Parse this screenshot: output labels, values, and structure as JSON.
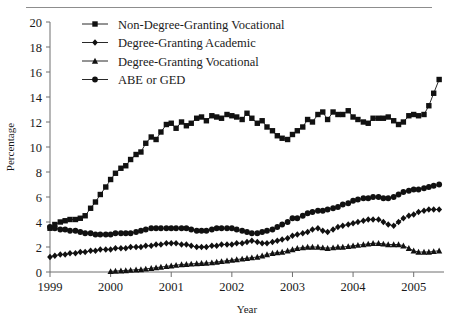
{
  "chart_data": {
    "type": "line",
    "title": "",
    "xlabel": "Year",
    "ylabel": "Percentage",
    "xlim": [
      1999,
      2005.5
    ],
    "ylim": [
      0,
      20
    ],
    "ytick_step": 2,
    "grid": false,
    "legend_position": "top-left-inside",
    "xticks": [
      "1999",
      "2000",
      "2001",
      "2002",
      "2003",
      "2004",
      "2005"
    ],
    "xtick_values": [
      1999,
      2000,
      2001,
      2002,
      2003,
      2004,
      2005
    ],
    "yticks": [
      "0",
      "2",
      "4",
      "6",
      "8",
      "10",
      "12",
      "14",
      "16",
      "18",
      "20"
    ],
    "ytick_values": [
      0,
      2,
      4,
      6,
      8,
      10,
      12,
      14,
      16,
      18,
      20
    ],
    "marker_color": "#111111",
    "line_color": "#111111",
    "series": [
      {
        "name": "Non-Degree-Granting Vocational",
        "marker": "square",
        "x": [
          1999.0,
          1999.08,
          1999.17,
          1999.25,
          1999.33,
          1999.42,
          1999.5,
          1999.58,
          1999.67,
          1999.75,
          1999.83,
          1999.92,
          2000.0,
          2000.08,
          2000.17,
          2000.25,
          2000.33,
          2000.42,
          2000.5,
          2000.58,
          2000.67,
          2000.75,
          2000.83,
          2000.92,
          2001.0,
          2001.08,
          2001.17,
          2001.25,
          2001.33,
          2001.42,
          2001.5,
          2001.58,
          2001.67,
          2001.75,
          2001.83,
          2001.92,
          2002.0,
          2002.08,
          2002.17,
          2002.25,
          2002.33,
          2002.42,
          2002.5,
          2002.58,
          2002.67,
          2002.75,
          2002.83,
          2002.92,
          2003.0,
          2003.08,
          2003.17,
          2003.25,
          2003.33,
          2003.42,
          2003.5,
          2003.58,
          2003.67,
          2003.75,
          2003.83,
          2003.92,
          2004.0,
          2004.08,
          2004.17,
          2004.25,
          2004.33,
          2004.42,
          2004.5,
          2004.58,
          2004.67,
          2004.75,
          2004.83,
          2004.92,
          2005.0,
          2005.08,
          2005.17,
          2005.25,
          2005.33,
          2005.42
        ],
        "values": [
          3.5,
          3.8,
          4.0,
          4.1,
          4.2,
          4.2,
          4.3,
          4.5,
          5.1,
          5.6,
          6.2,
          6.8,
          7.4,
          7.9,
          8.3,
          8.5,
          9.0,
          9.4,
          9.6,
          10.3,
          10.8,
          10.6,
          11.2,
          11.8,
          11.9,
          11.5,
          12.0,
          11.7,
          11.9,
          12.3,
          12.4,
          12.1,
          12.5,
          12.4,
          12.3,
          12.6,
          12.5,
          12.4,
          12.2,
          12.7,
          12.3,
          11.9,
          12.1,
          11.6,
          11.3,
          10.9,
          10.7,
          10.6,
          11.0,
          11.3,
          11.6,
          12.2,
          12.0,
          12.6,
          12.8,
          12.2,
          12.8,
          12.6,
          12.6,
          12.9,
          12.4,
          12.2,
          12.0,
          11.9,
          12.3,
          12.3,
          12.3,
          12.4,
          12.1,
          11.8,
          12.0,
          12.5,
          12.6,
          12.5,
          12.6,
          13.3,
          14.3,
          15.4
        ]
      },
      {
        "name": "Degree-Granting Academic",
        "marker": "diamond",
        "x": [
          1999.0,
          1999.08,
          1999.17,
          1999.25,
          1999.33,
          1999.42,
          1999.5,
          1999.58,
          1999.67,
          1999.75,
          1999.83,
          1999.92,
          2000.0,
          2000.08,
          2000.17,
          2000.25,
          2000.33,
          2000.42,
          2000.5,
          2000.58,
          2000.67,
          2000.75,
          2000.83,
          2000.92,
          2001.0,
          2001.08,
          2001.17,
          2001.25,
          2001.33,
          2001.42,
          2001.5,
          2001.58,
          2001.67,
          2001.75,
          2001.83,
          2001.92,
          2002.0,
          2002.08,
          2002.17,
          2002.25,
          2002.33,
          2002.42,
          2002.5,
          2002.58,
          2002.67,
          2002.75,
          2002.83,
          2002.92,
          2003.0,
          2003.08,
          2003.17,
          2003.25,
          2003.33,
          2003.42,
          2003.5,
          2003.58,
          2003.67,
          2003.75,
          2003.83,
          2003.92,
          2004.0,
          2004.08,
          2004.17,
          2004.25,
          2004.33,
          2004.42,
          2004.5,
          2004.58,
          2004.67,
          2004.75,
          2004.83,
          2004.92,
          2005.0,
          2005.08,
          2005.17,
          2005.25,
          2005.33,
          2005.42
        ],
        "values": [
          1.2,
          1.3,
          1.4,
          1.4,
          1.5,
          1.5,
          1.6,
          1.6,
          1.7,
          1.7,
          1.8,
          1.8,
          1.8,
          1.9,
          1.9,
          1.9,
          2.0,
          2.0,
          2.0,
          2.1,
          2.1,
          2.2,
          2.2,
          2.3,
          2.3,
          2.3,
          2.2,
          2.2,
          2.1,
          2.0,
          2.0,
          2.0,
          2.1,
          2.1,
          2.2,
          2.2,
          2.2,
          2.3,
          2.3,
          2.4,
          2.5,
          2.4,
          2.3,
          2.3,
          2.4,
          2.5,
          2.6,
          2.7,
          2.9,
          3.0,
          3.1,
          3.2,
          3.4,
          3.5,
          3.3,
          3.2,
          3.4,
          3.6,
          3.7,
          3.8,
          3.9,
          4.0,
          4.1,
          4.2,
          4.2,
          4.2,
          4.0,
          3.8,
          3.7,
          4.0,
          4.3,
          4.5,
          4.6,
          4.8,
          4.9,
          5.0,
          5.0,
          5.0
        ]
      },
      {
        "name": "Degree-Granting Vocational",
        "marker": "triangle",
        "x": [
          2000.0,
          2000.08,
          2000.17,
          2000.25,
          2000.33,
          2000.42,
          2000.5,
          2000.58,
          2000.67,
          2000.75,
          2000.83,
          2000.92,
          2001.0,
          2001.08,
          2001.17,
          2001.25,
          2001.33,
          2001.42,
          2001.5,
          2001.58,
          2001.67,
          2001.75,
          2001.83,
          2001.92,
          2002.0,
          2002.08,
          2002.17,
          2002.25,
          2002.33,
          2002.42,
          2002.5,
          2002.58,
          2002.67,
          2002.75,
          2002.83,
          2002.92,
          2003.0,
          2003.08,
          2003.17,
          2003.25,
          2003.33,
          2003.42,
          2003.5,
          2003.58,
          2003.67,
          2003.75,
          2003.83,
          2003.92,
          2004.0,
          2004.08,
          2004.17,
          2004.25,
          2004.33,
          2004.42,
          2004.5,
          2004.58,
          2004.67,
          2004.75,
          2004.83,
          2004.92,
          2005.0,
          2005.08,
          2005.17,
          2005.25,
          2005.33,
          2005.42
        ],
        "values": [
          0.05,
          0.08,
          0.1,
          0.12,
          0.15,
          0.18,
          0.2,
          0.25,
          0.3,
          0.35,
          0.4,
          0.45,
          0.5,
          0.55,
          0.6,
          0.62,
          0.65,
          0.68,
          0.7,
          0.72,
          0.75,
          0.8,
          0.85,
          0.9,
          0.95,
          1.0,
          1.05,
          1.1,
          1.15,
          1.2,
          1.3,
          1.4,
          1.5,
          1.55,
          1.6,
          1.7,
          1.8,
          1.9,
          1.95,
          2.0,
          2.0,
          2.0,
          1.95,
          1.9,
          1.95,
          2.0,
          2.0,
          2.05,
          2.1,
          2.15,
          2.2,
          2.25,
          2.3,
          2.3,
          2.25,
          2.2,
          2.2,
          2.2,
          2.1,
          1.9,
          1.7,
          1.6,
          1.6,
          1.6,
          1.65,
          1.7
        ]
      },
      {
        "name": "ABE or GED",
        "marker": "circle",
        "x": [
          1999.0,
          1999.08,
          1999.17,
          1999.25,
          1999.33,
          1999.42,
          1999.5,
          1999.58,
          1999.67,
          1999.75,
          1999.83,
          1999.92,
          2000.0,
          2000.08,
          2000.17,
          2000.25,
          2000.33,
          2000.42,
          2000.5,
          2000.58,
          2000.67,
          2000.75,
          2000.83,
          2000.92,
          2001.0,
          2001.08,
          2001.17,
          2001.25,
          2001.33,
          2001.42,
          2001.5,
          2001.58,
          2001.67,
          2001.75,
          2001.83,
          2001.92,
          2002.0,
          2002.08,
          2002.17,
          2002.25,
          2002.33,
          2002.42,
          2002.5,
          2002.58,
          2002.67,
          2002.75,
          2002.83,
          2002.92,
          2003.0,
          2003.08,
          2003.17,
          2003.25,
          2003.33,
          2003.42,
          2003.5,
          2003.58,
          2003.67,
          2003.75,
          2003.83,
          2003.92,
          2004.0,
          2004.08,
          2004.17,
          2004.25,
          2004.33,
          2004.42,
          2004.5,
          2004.58,
          2004.67,
          2004.75,
          2004.83,
          2004.92,
          2005.0,
          2005.08,
          2005.17,
          2005.25,
          2005.33,
          2005.42
        ],
        "values": [
          3.6,
          3.5,
          3.4,
          3.4,
          3.3,
          3.3,
          3.2,
          3.1,
          3.1,
          3.0,
          3.0,
          3.0,
          3.0,
          3.1,
          3.1,
          3.1,
          3.1,
          3.2,
          3.3,
          3.4,
          3.5,
          3.5,
          3.5,
          3.5,
          3.5,
          3.5,
          3.5,
          3.5,
          3.4,
          3.3,
          3.3,
          3.3,
          3.4,
          3.5,
          3.5,
          3.5,
          3.5,
          3.4,
          3.3,
          3.2,
          3.1,
          3.1,
          3.2,
          3.3,
          3.4,
          3.6,
          3.8,
          4.0,
          4.3,
          4.3,
          4.5,
          4.7,
          4.8,
          4.9,
          4.9,
          5.0,
          5.1,
          5.2,
          5.4,
          5.5,
          5.7,
          5.8,
          5.9,
          5.9,
          6.0,
          6.0,
          5.9,
          5.9,
          6.0,
          6.2,
          6.4,
          6.5,
          6.6,
          6.6,
          6.7,
          6.8,
          6.9,
          7.0
        ]
      }
    ]
  },
  "legend": {
    "entries": [
      {
        "label": "Non-Degree-Granting Vocational",
        "marker": "square"
      },
      {
        "label": "Degree-Granting Academic",
        "marker": "diamond"
      },
      {
        "label": "Degree-Granting Vocational",
        "marker": "triangle"
      },
      {
        "label": "ABE or GED",
        "marker": "circle"
      }
    ]
  }
}
